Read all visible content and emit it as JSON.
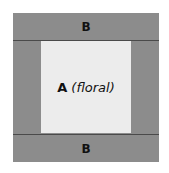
{
  "diagram": {
    "type": "quilt-block-layout",
    "colors": {
      "border_fabric": "#8c8c8c",
      "center_fabric": "#ececec",
      "seam_line": "#4a4a4a",
      "text": "#111111"
    },
    "top_band": {
      "label": "B"
    },
    "bottom_band": {
      "label": "B"
    },
    "center": {
      "label": "A",
      "note": "(floral)"
    }
  }
}
